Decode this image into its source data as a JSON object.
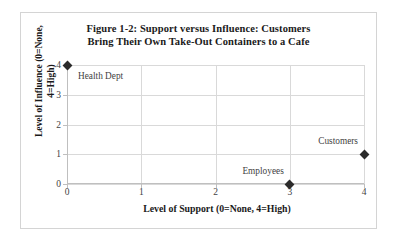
{
  "chart_data": {
    "type": "scatter",
    "title": "Figure 1-2: Support versus Influence: Customers Bring Their Own Take-Out Containers to a Cafe",
    "title_lines": [
      "Figure 1-2: Support versus Influence: Customers",
      "Bring  Their Own Take-Out Containers to a Cafe"
    ],
    "xlabel": "Level of Support (0=None, 4=High)",
    "ylabel": "Level of Influence (0=None, 4=High)",
    "ylabel_lines": [
      "Level of Influence (0=None,",
      "4=High)"
    ],
    "xlim": [
      0,
      4
    ],
    "ylim": [
      0,
      4
    ],
    "xticks": [
      "0",
      "1",
      "2",
      "3",
      "4"
    ],
    "yticks": [
      "4",
      "3",
      "2",
      "1",
      "0"
    ],
    "grid": true,
    "legend": "none",
    "marker": "diamond",
    "marker_color": "#2b2b2b",
    "grid_color": "#d9d9d9",
    "axis_color": "#bfbfbf",
    "points": [
      {
        "label": "Health Dept",
        "x": 0,
        "y": 4,
        "label_pos": "below-right"
      },
      {
        "label": "Employees",
        "x": 3,
        "y": 0,
        "label_pos": "above-left"
      },
      {
        "label": "Customers",
        "x": 4,
        "y": 1,
        "label_pos": "above-left"
      }
    ]
  }
}
